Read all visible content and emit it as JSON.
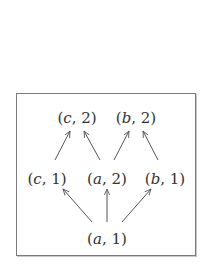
{
  "diagram": {
    "type": "hasse-diagram",
    "colors": {
      "text": "#333333",
      "edge": "#555555",
      "frame": "#7a7a7a",
      "background": "#ffffff"
    },
    "nodes": [
      {
        "id": "c2",
        "var": "c",
        "num": "2",
        "x": 77,
        "y": 119
      },
      {
        "id": "b2",
        "var": "b",
        "num": "2",
        "x": 136,
        "y": 119
      },
      {
        "id": "c1",
        "var": "c",
        "num": "1",
        "x": 47,
        "y": 180
      },
      {
        "id": "a2",
        "var": "a",
        "num": "2",
        "x": 107,
        "y": 180
      },
      {
        "id": "b1",
        "var": "b",
        "num": "1",
        "x": 165,
        "y": 180
      },
      {
        "id": "a1",
        "var": "a",
        "num": "1",
        "x": 107,
        "y": 240
      }
    ],
    "edges": [
      {
        "from": "c1",
        "to": "c2",
        "x1": 55,
        "y1": 160,
        "x2": 70,
        "y2": 131
      },
      {
        "from": "a2",
        "to": "c2",
        "x1": 100,
        "y1": 160,
        "x2": 84,
        "y2": 131
      },
      {
        "from": "a2",
        "to": "b2",
        "x1": 114,
        "y1": 160,
        "x2": 129,
        "y2": 131
      },
      {
        "from": "b1",
        "to": "b2",
        "x1": 158,
        "y1": 160,
        "x2": 143,
        "y2": 131
      },
      {
        "from": "a1",
        "to": "c1",
        "x1": 92,
        "y1": 222,
        "x2": 63,
        "y2": 189
      },
      {
        "from": "a1",
        "to": "a2",
        "x1": 107,
        "y1": 222,
        "x2": 107,
        "y2": 189
      },
      {
        "from": "a1",
        "to": "b1",
        "x1": 122,
        "y1": 222,
        "x2": 151,
        "y2": 189
      }
    ]
  }
}
